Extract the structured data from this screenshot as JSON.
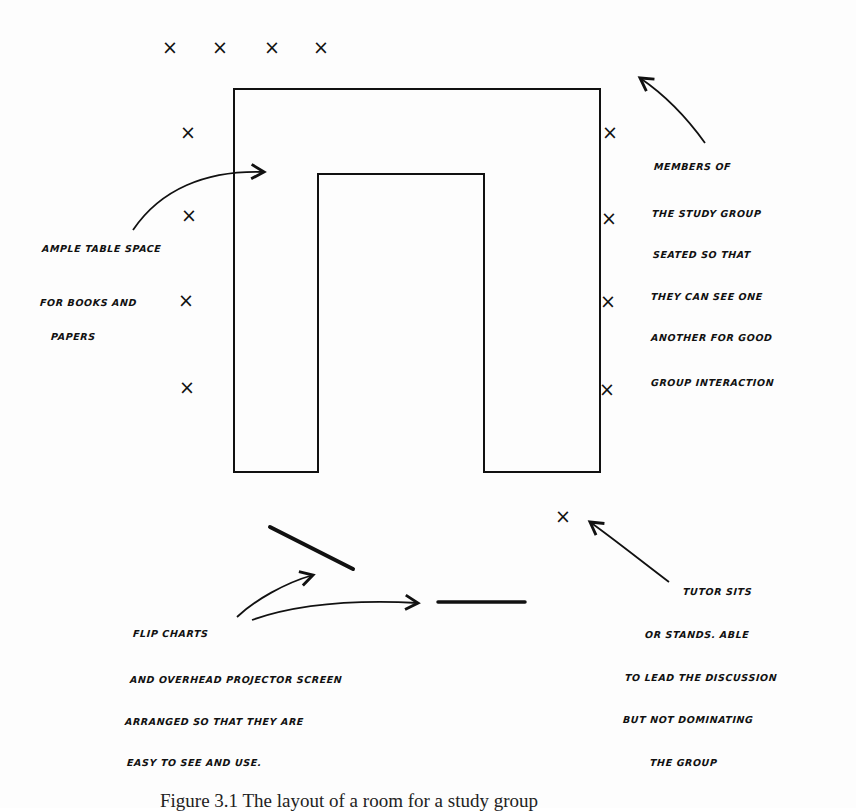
{
  "diagram": {
    "type": "room-layout",
    "table_shape": "U-shaped table",
    "colors": {
      "ink": "#111111",
      "paper": "#fdfdfd"
    },
    "seats": {
      "top": [
        {
          "x": 170,
          "y": 48
        },
        {
          "x": 220,
          "y": 48
        },
        {
          "x": 272,
          "y": 48
        },
        {
          "x": 321,
          "y": 48
        }
      ],
      "left": [
        {
          "x": 188,
          "y": 133
        },
        {
          "x": 189,
          "y": 216
        },
        {
          "x": 186,
          "y": 301
        },
        {
          "x": 187,
          "y": 388
        }
      ],
      "right": [
        {
          "x": 610,
          "y": 133
        },
        {
          "x": 609,
          "y": 219
        },
        {
          "x": 608,
          "y": 302
        },
        {
          "x": 607,
          "y": 390
        }
      ],
      "tutor": {
        "x": 563,
        "y": 517
      },
      "mark": "×"
    },
    "annotations": {
      "table_space": [
        "AMPLE TABLE SPACE",
        "FOR BOOKS AND",
        "PAPERS"
      ],
      "members": [
        "MEMBERS OF",
        "THE STUDY GROUP",
        "SEATED SO THAT",
        "THEY CAN SEE  ONE",
        "ANOTHER FOR GOOD",
        "GROUP INTERACTION"
      ],
      "equipment": [
        "FLIP CHARTS",
        "AND OVERHEAD PROJECTOR  SCREEN",
        "ARRANGED SO THAT THEY ARE",
        "EASY TO SEE AND USE."
      ],
      "tutor": [
        "TUTOR SITS",
        "OR STANDS. ABLE",
        "TO LEAD THE DISCUSSION",
        "BUT NOT DOMINATING",
        "THE GROUP"
      ]
    },
    "caption": "Figure 3.1   The layout of a room for a study group"
  }
}
